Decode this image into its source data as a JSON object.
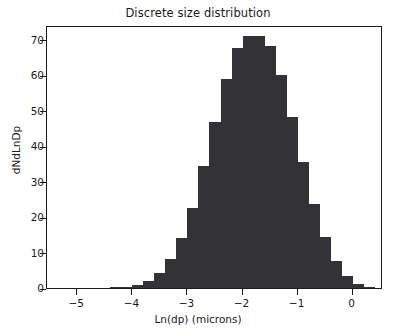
{
  "chart_data": {
    "type": "bar",
    "title": "Discrete size distribution",
    "xlabel": "Ln(dp) (microns)",
    "ylabel": "dNdLnDp",
    "xlim": [
      -5.55,
      0.55
    ],
    "ylim": [
      0,
      74.2
    ],
    "grid": false,
    "legend": null,
    "bar_color": "#333337",
    "bin_width": 0.2,
    "xticks": [
      -5,
      -4,
      -3,
      -2,
      -1,
      0
    ],
    "xtick_labels": [
      "−5",
      "−4",
      "−3",
      "−2",
      "−1",
      "0"
    ],
    "yticks": [
      0,
      10,
      20,
      30,
      40,
      50,
      60,
      70
    ],
    "ytick_labels": [
      "0",
      "10",
      "20",
      "30",
      "40",
      "50",
      "60",
      "70"
    ],
    "x": [
      -4.3,
      -4.1,
      -3.9,
      -3.7,
      -3.5,
      -3.3,
      -3.1,
      -2.9,
      -2.7,
      -2.5,
      -2.3,
      -2.1,
      -1.9,
      -1.7,
      -1.5,
      -1.3,
      -1.1,
      -0.9,
      -0.7,
      -0.5,
      -0.3,
      -0.1,
      0.1,
      0.3
    ],
    "values": [
      0.2,
      0.4,
      0.9,
      2.0,
      4.3,
      8.3,
      14.2,
      22.6,
      34.4,
      46.8,
      58.9,
      67.6,
      71.2,
      71.2,
      68.3,
      60.2,
      48.3,
      35.5,
      23.8,
      14.3,
      7.6,
      3.5,
      1.2,
      0.4
    ]
  }
}
